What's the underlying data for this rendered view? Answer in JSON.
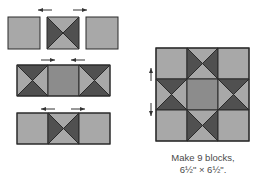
{
  "colors": {
    "light": "#a8a8a8",
    "medium": "#8c8c8c",
    "dark": "#505050",
    "outline": "#2a2a2a",
    "arrow": "#333333"
  },
  "diagram": {
    "rows": [
      {
        "name": "row-1",
        "units": [
          "light-square",
          "hourglass-vertical-dark",
          "light-square"
        ],
        "joined": false,
        "press_arrows": [
          "left",
          "right"
        ]
      },
      {
        "name": "row-2",
        "units": [
          "hourglass-horizontal-dark",
          "medium-square",
          "hourglass-horizontal-dark"
        ],
        "joined": true,
        "press_arrows": [
          "right",
          "left"
        ]
      },
      {
        "name": "row-3",
        "units": [
          "light-square",
          "hourglass-vertical-dark",
          "light-square"
        ],
        "joined": true,
        "press_arrows": [
          "left",
          "right"
        ]
      }
    ],
    "finished_block": {
      "grid": [
        [
          "light-square",
          "star-point-top",
          "light-square"
        ],
        [
          "star-point-left",
          "medium-square",
          "star-point-right"
        ],
        [
          "light-square",
          "star-point-bottom",
          "light-square"
        ]
      ],
      "press_arrows": [
        "up",
        "down"
      ]
    }
  },
  "caption": {
    "line1": "Make 9 blocks,",
    "line2": "6½\" × 6½\"."
  }
}
